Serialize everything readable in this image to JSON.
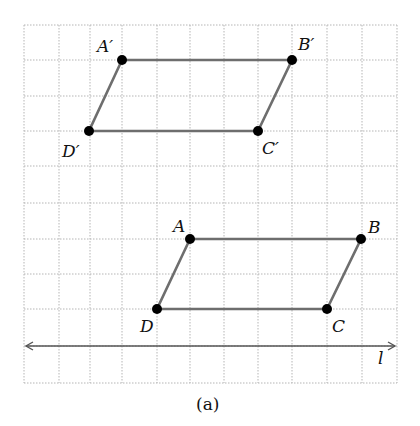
{
  "figure": {
    "caption": "(a)",
    "grid": {
      "x_lines": [
        24,
        59,
        90,
        122,
        157,
        190,
        224,
        258,
        292,
        327,
        362,
        397
      ],
      "y_lines": [
        25,
        60,
        96,
        131,
        166,
        203,
        239,
        274,
        309,
        346,
        383
      ]
    },
    "line_l": {
      "label": "l",
      "x1": 24,
      "y": 346,
      "x2": 397,
      "arrows": "both"
    },
    "image_parallelogram": {
      "name": "A'B'C'D'",
      "vertices": [
        {
          "label": "A′",
          "x": 122,
          "y": 60
        },
        {
          "label": "B′",
          "x": 292,
          "y": 60
        },
        {
          "label": "C′",
          "x": 258,
          "y": 131
        },
        {
          "label": "D′",
          "x": 89,
          "y": 131
        }
      ]
    },
    "original_parallelogram": {
      "name": "ABCD",
      "vertices": [
        {
          "label": "A",
          "x": 190,
          "y": 239
        },
        {
          "label": "B",
          "x": 361,
          "y": 239
        },
        {
          "label": "C",
          "x": 327,
          "y": 309
        },
        {
          "label": "D",
          "x": 157,
          "y": 309
        }
      ]
    },
    "labels": {
      "A_prime": "A′",
      "B_prime": "B′",
      "C_prime": "C′",
      "D_prime": "D′",
      "A": "A",
      "B": "B",
      "C": "C",
      "D": "D",
      "l": "l"
    }
  }
}
